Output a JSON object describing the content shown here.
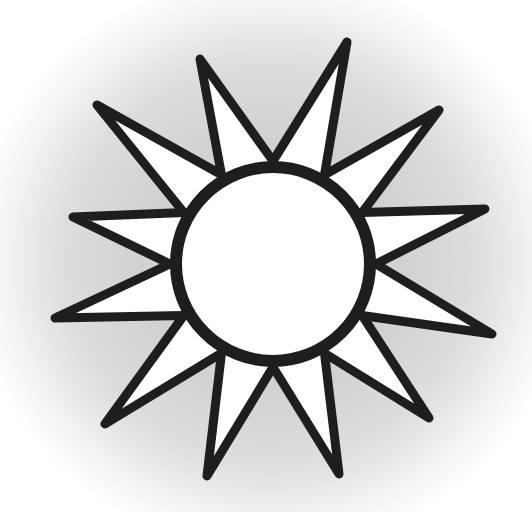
{
  "illustration": {
    "subject": "sun-icon",
    "ray_count": 12,
    "colors": {
      "outline": "#1e1e1e",
      "fill": "#ffffff",
      "background_center": "#c9c9c9",
      "background_edge": "#ffffff"
    },
    "center": {
      "x": 273,
      "y": 264
    },
    "disc": {
      "radius": 97,
      "stroke_width": 12
    },
    "rays": {
      "stroke_width": 9
    }
  }
}
